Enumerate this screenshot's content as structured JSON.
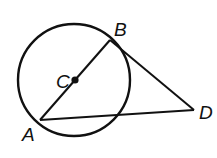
{
  "diagram": {
    "circle": {
      "cx": 74,
      "cy": 80,
      "r": 56
    },
    "points": {
      "A": {
        "label": "A",
        "x": 40,
        "y": 120,
        "lx": 22,
        "ly": 141
      },
      "B": {
        "label": "B",
        "x": 110,
        "y": 40,
        "lx": 114,
        "ly": 36
      },
      "C": {
        "label": "C",
        "x": 75,
        "y": 80,
        "lx": 56,
        "ly": 88
      },
      "D": {
        "label": "D",
        "x": 194,
        "y": 110,
        "lx": 199,
        "ly": 119
      }
    },
    "segments": [
      "AB",
      "BD",
      "AD"
    ],
    "stroke_color": "#111111"
  }
}
